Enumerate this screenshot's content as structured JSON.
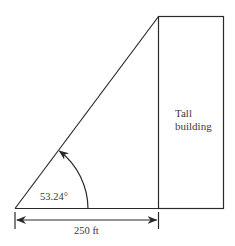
{
  "diagram": {
    "building_label_line1": "Tall",
    "building_label_line2": "building",
    "angle_label": "53.24°",
    "distance_label": "250 ft",
    "colors": {
      "stroke": "#2a2a2a",
      "text": "#3a3a3a",
      "background": "#ffffff"
    }
  }
}
